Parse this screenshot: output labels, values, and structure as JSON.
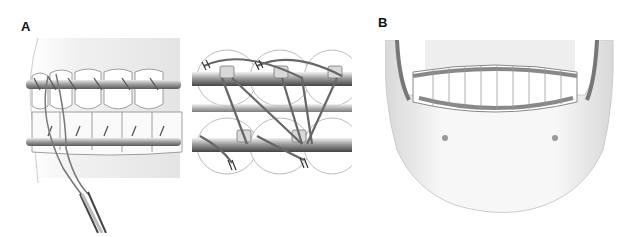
{
  "figure": {
    "panels": [
      {
        "label": "A",
        "description": "Lateral view of arch bars with circumdental wiring and wire twister"
      },
      {
        "label": "A",
        "description": "Close-up of arch bars with interdental wires"
      },
      {
        "label": "B",
        "description": "Frontal view of mandible with maxillomandibular fixation arch bars"
      }
    ]
  }
}
